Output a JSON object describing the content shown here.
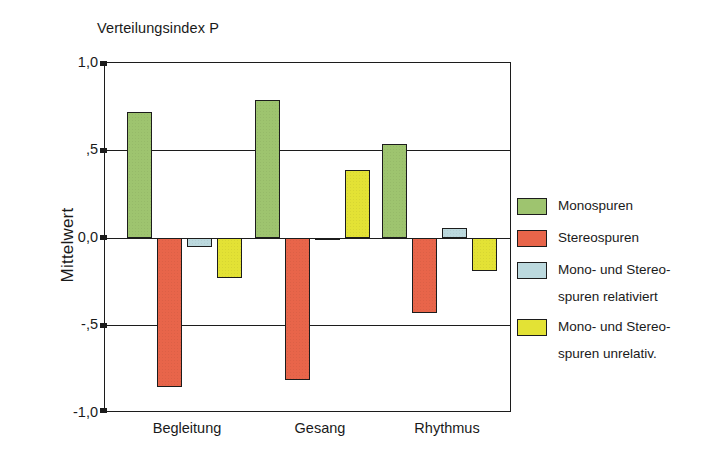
{
  "chart_data": {
    "type": "bar",
    "title": "Verteilungsindex P",
    "xlabel": "",
    "ylabel": "Mittelwert",
    "categories": [
      "Begleitung",
      "Gesang",
      "Rhythmus"
    ],
    "ylim": [
      -1.0,
      1.0
    ],
    "ytick_labels": [
      "1,0",
      ",5",
      "0,0",
      "-,5",
      "-1,0"
    ],
    "ytick_values": [
      1.0,
      0.5,
      0.0,
      -0.5,
      -1.0
    ],
    "grid": true,
    "legend_position": "right",
    "series": [
      {
        "name": "Monospuren",
        "color": "#9ec46f",
        "values": [
          0.72,
          0.79,
          0.54
        ]
      },
      {
        "name": "Stereospuren",
        "color": "#e8654a",
        "values": [
          -0.85,
          -0.81,
          -0.43
        ]
      },
      {
        "name": "Mono- und Stereo-spuren relativiert",
        "color": "#bcd9de",
        "values": [
          -0.05,
          -0.01,
          0.06
        ]
      },
      {
        "name": "Mono- und Stereo-spuren unrelativ.",
        "color": "#e3e235",
        "values": [
          -0.23,
          0.39,
          -0.19
        ]
      }
    ]
  },
  "legend": {
    "entries": [
      {
        "line1": "Monospuren",
        "line2": ""
      },
      {
        "line1": "Stereospuren",
        "line2": ""
      },
      {
        "line1": "Mono- und Stereo-",
        "line2": "spuren relativiert"
      },
      {
        "line1": "Mono- und Stereo-",
        "line2": "spuren unrelativ."
      }
    ]
  },
  "axes": {
    "y_ticks": [
      {
        "label": "1,0"
      },
      {
        "label": ",5"
      },
      {
        "label": "0,0"
      },
      {
        "label": "-,5"
      },
      {
        "label": "-1,0"
      }
    ],
    "x_ticks": [
      {
        "label": "Begleitung"
      },
      {
        "label": "Gesang"
      },
      {
        "label": "Rhythmus"
      }
    ]
  }
}
